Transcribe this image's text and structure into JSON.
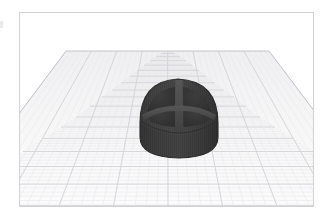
{
  "app": {
    "view_label": "3D viewport",
    "panel_label": "design workspace"
  },
  "viewport": {
    "background_color": "#ffffff",
    "border_color": "#d2d2d4",
    "workplane": {
      "label": "workplane grid",
      "fill_color": "#f5f5f6",
      "minor_grid_color": "#e4e4e6",
      "major_grid_color": "#cfcfd4",
      "edge_color": "#c9c9cf",
      "minor_divisions": 40,
      "major_every": 5,
      "projection": "perspective",
      "back_edge_y": 38,
      "front_edge_y": 193,
      "back_left_x": 46,
      "back_right_x": 249,
      "front_left_x": -70,
      "front_right_x": 366
    },
    "object": {
      "label": "dome with cross ribs",
      "shape": "hemisphere-dome",
      "base_color": "#3f3f3f",
      "shadow_color": "#303030",
      "highlight_color": "#555555",
      "rib_color": "#4a4a4a",
      "rib_shadow_color": "#2e2e2e",
      "cavity_color": "#363636",
      "outline_color": "#2a2a2a",
      "center_x": 168,
      "center_y": 106,
      "width": 78,
      "height": 86,
      "features": [
        "vertical-ribbed-skirt",
        "cross-shaped-top-rib",
        "four-recessed-quadrants",
        "rounded-base"
      ]
    }
  }
}
